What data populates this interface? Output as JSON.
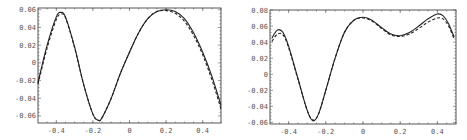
{
  "chart_data": [
    {
      "type": "line",
      "title": "",
      "xlabel": "",
      "ylabel": "",
      "xlim": [
        -0.5,
        0.5
      ],
      "ylim": [
        -0.068,
        0.062
      ],
      "grid": false,
      "legend": null,
      "x_ticks": [
        -0.4,
        -0.2,
        0,
        0.2,
        0.4
      ],
      "x_tick_labels": [
        "-0.4",
        "-0.2",
        "0",
        "0.2",
        "0.4"
      ],
      "y_ticks": [
        0.06,
        0.04,
        0.02,
        0,
        -0.02,
        -0.04,
        -0.06
      ],
      "y_tick_labels": [
        "0.06",
        "0.04",
        "0.02",
        "0",
        "-0.02",
        "-0.04",
        "-0.06"
      ],
      "x": [
        -0.5,
        -0.45,
        -0.4,
        -0.375,
        -0.35,
        -0.3,
        -0.25,
        -0.2,
        -0.17,
        -0.15,
        -0.1,
        -0.05,
        0,
        0.05,
        0.1,
        0.15,
        0.2,
        0.25,
        0.3,
        0.35,
        0.4,
        0.45,
        0.5
      ],
      "series": [
        {
          "name": "solid",
          "style": "solid",
          "values": [
            -0.022,
            0.02,
            0.052,
            0.057,
            0.052,
            0.018,
            -0.025,
            -0.058,
            -0.065,
            -0.062,
            -0.04,
            -0.012,
            0.012,
            0.034,
            0.05,
            0.058,
            0.06,
            0.058,
            0.05,
            0.034,
            0.012,
            -0.015,
            -0.048
          ]
        },
        {
          "name": "dashed",
          "style": "dashed",
          "values": [
            -0.024,
            0.017,
            0.049,
            0.055,
            0.051,
            0.017,
            -0.025,
            -0.058,
            -0.065,
            -0.062,
            -0.04,
            -0.012,
            0.012,
            0.034,
            0.05,
            0.058,
            0.059,
            0.056,
            0.047,
            0.031,
            0.009,
            -0.019,
            -0.052
          ]
        }
      ]
    },
    {
      "type": "line",
      "title": "",
      "xlabel": "",
      "ylabel": "",
      "xlim": [
        -0.5,
        0.5
      ],
      "ylim": [
        -0.062,
        0.08
      ],
      "grid": false,
      "legend": null,
      "x_ticks": [
        -0.4,
        -0.2,
        0,
        0.2,
        0.4
      ],
      "x_tick_labels": [
        "-0.4",
        "-0.2",
        "0",
        "0.2",
        "0.4"
      ],
      "y_ticks": [
        0.08,
        0.06,
        0.04,
        0.02,
        0,
        -0.02,
        -0.04,
        -0.06
      ],
      "y_tick_labels": [
        "0.08",
        "0.06",
        "0.04",
        "0.02",
        "0",
        "-0.02",
        "-0.04",
        "-0.06"
      ],
      "x": [
        -0.49,
        -0.46,
        -0.43,
        -0.4,
        -0.35,
        -0.3,
        -0.27,
        -0.24,
        -0.2,
        -0.15,
        -0.1,
        -0.05,
        0,
        0.05,
        0.1,
        0.15,
        0.2,
        0.25,
        0.3,
        0.35,
        0.4,
        0.43,
        0.46,
        0.49
      ],
      "series": [
        {
          "name": "solid",
          "style": "solid",
          "values": [
            0.045,
            0.055,
            0.052,
            0.035,
            -0.005,
            -0.045,
            -0.058,
            -0.05,
            -0.02,
            0.02,
            0.052,
            0.067,
            0.071,
            0.067,
            0.058,
            0.05,
            0.048,
            0.052,
            0.06,
            0.069,
            0.075,
            0.073,
            0.063,
            0.046
          ]
        },
        {
          "name": "dashed",
          "style": "dashed",
          "values": [
            0.041,
            0.05,
            0.049,
            0.033,
            -0.006,
            -0.045,
            -0.057,
            -0.05,
            -0.02,
            0.02,
            0.052,
            0.067,
            0.07,
            0.066,
            0.057,
            0.049,
            0.047,
            0.05,
            0.057,
            0.065,
            0.07,
            0.069,
            0.06,
            0.044
          ]
        }
      ]
    }
  ],
  "layout": {
    "left": {
      "frame": {
        "x": 38,
        "y": 8,
        "w": 183,
        "h": 115
      }
    },
    "right": {
      "frame": {
        "x": 37,
        "y": 10,
        "w": 186,
        "h": 114
      }
    }
  }
}
